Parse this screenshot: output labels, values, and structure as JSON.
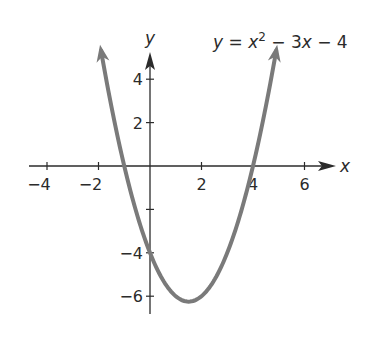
{
  "chart_data": {
    "type": "line",
    "equation": {
      "lhs": "y",
      "eq": " = ",
      "x": "x",
      "exp": "2",
      "rest1": " − 3",
      "x2": "x",
      "rest2": " − 4"
    },
    "xlabel": "x",
    "ylabel": "y",
    "xlim": [
      -5,
      7
    ],
    "ylim": [
      -7,
      5.5
    ],
    "x_ticks": [
      -4,
      -2,
      2,
      4,
      6
    ],
    "x_tick_labels": [
      "−4",
      "−2",
      "2",
      "4",
      "6"
    ],
    "y_ticks": [
      4,
      2,
      -2,
      -4,
      -6
    ],
    "y_tick_labels": [
      "4",
      "2",
      "",
      "−4",
      "−6"
    ],
    "grid": false,
    "series": [
      {
        "name": "y = x^2 - 3x - 4",
        "color": "#7a7a7a",
        "function": {
          "a": 1,
          "b": -3,
          "c": -4
        },
        "x_range": [
          -1.9,
          4.9
        ],
        "key_points": [
          {
            "x": -1,
            "y": 0
          },
          {
            "x": 0,
            "y": -4
          },
          {
            "x": 1.5,
            "y": -6.25
          },
          {
            "x": 3,
            "y": -4
          },
          {
            "x": 4,
            "y": 0
          }
        ],
        "arrows_at_ends": true
      }
    ]
  }
}
